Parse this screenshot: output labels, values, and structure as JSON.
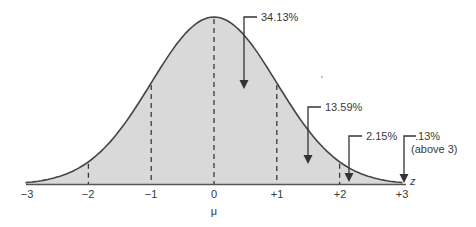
{
  "chart_data": {
    "type": "area",
    "title": "",
    "subtitle": "",
    "xlabel": "z",
    "center_label": "μ",
    "ylabel": "",
    "xlim": [
      -3,
      3
    ],
    "grid": false,
    "legend": null,
    "curve": "standard normal distribution",
    "tick_labels": [
      "−3",
      "−2",
      "−1",
      "0",
      "+1",
      "+2",
      "+3"
    ],
    "x": [
      -3,
      -2,
      -1,
      0,
      1,
      2,
      3
    ],
    "dashed_lines_at": [
      -2,
      -1,
      0,
      1,
      2
    ],
    "annotations": [
      {
        "text": "34.13%",
        "region": "0 to +1",
        "value": 34.13
      },
      {
        "text": "13.59%",
        "region": "+1 to +2",
        "value": 13.59
      },
      {
        "text": "2.15%",
        "region": "+2 to +3",
        "value": 2.15
      },
      {
        "text": ".13%",
        "subtext": "(above 3)",
        "region": "above +3",
        "value": 0.13
      }
    ],
    "fill_color": "#d9d9d9",
    "line_color": "#444444"
  },
  "labels": {
    "ticks": [
      "−3",
      "−2",
      "−1",
      "0",
      "+1",
      "+2",
      "+3"
    ],
    "mu": "μ",
    "z": "z",
    "a1": "34.13%",
    "a2": "13.59%",
    "a3": "2.15%",
    "a4": ".13%",
    "a4sub": "(above 3)"
  }
}
